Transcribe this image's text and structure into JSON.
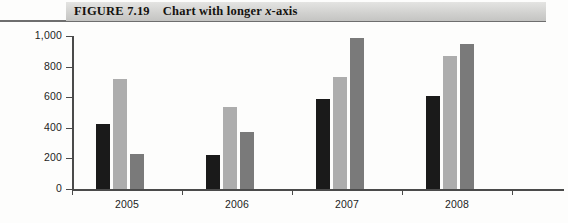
{
  "caption": {
    "figure_number": "FIGURE 7.19",
    "title": "Chart with longer x-axis",
    "title_plain": "Chart with longer ",
    "title_italic": "x",
    "title_tail": "-axis"
  },
  "chart_data": {
    "type": "bar",
    "title": "Chart with longer x-axis",
    "xlabel": "",
    "ylabel": "",
    "categories": [
      "2005",
      "2006",
      "2007",
      "2008"
    ],
    "series": [
      {
        "name": "Series 1",
        "color": "#1a1a1a",
        "values": [
          425,
          220,
          585,
          610
        ]
      },
      {
        "name": "Series 2",
        "color": "#adadad",
        "values": [
          720,
          535,
          730,
          870
        ]
      },
      {
        "name": "Series 3",
        "color": "#7a7a7a",
        "values": [
          230,
          375,
          985,
          945
        ]
      }
    ],
    "ylim": [
      0,
      1000
    ],
    "yticks": [
      0,
      200,
      400,
      600,
      800,
      1000
    ],
    "ytick_labels": [
      "0",
      "200",
      "400",
      "600",
      "800",
      "1,000"
    ],
    "grid": false,
    "legend": "none",
    "axis_color": "#4a4a4a",
    "background": "#fdfdfc"
  },
  "axes": {
    "y_tick_labels": [
      "1,000",
      "800",
      "600",
      "400",
      "200",
      "0"
    ],
    "x_tick_labels": [
      "2005",
      "2006",
      "2007",
      "2008"
    ]
  }
}
